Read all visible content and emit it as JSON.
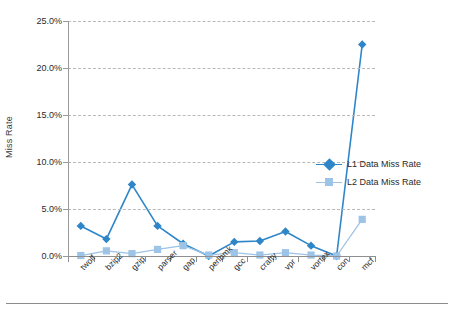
{
  "chart_data": {
    "type": "line",
    "title": "",
    "xlabel": "",
    "ylabel": "Miss Rate",
    "categories": [
      "twolf",
      "bzip2",
      "gzip",
      "parser",
      "gap",
      "perlbmk",
      "gcc",
      "crafty",
      "vpr",
      "vortex",
      "con",
      "mcf"
    ],
    "ylim": [
      0,
      25
    ],
    "ytick_labels": [
      "0.0%",
      "5.0%",
      "10.0%",
      "15.0%",
      "20.0%",
      "25.0%"
    ],
    "ytick_values": [
      0,
      5,
      10,
      15,
      20,
      25
    ],
    "grid": true,
    "grid_style": "dashed-horizontal",
    "legend_position": "right",
    "series": [
      {
        "name": "L1 Data Miss Rate",
        "color": "#2E86C8",
        "marker": "diamond",
        "values": [
          3.2,
          1.8,
          7.6,
          3.2,
          1.3,
          0.0,
          1.5,
          1.6,
          2.6,
          1.1,
          0.0,
          22.5
        ]
      },
      {
        "name": "L2 Data Miss Rate",
        "color": "#9DC3E6",
        "marker": "square",
        "values": [
          0.05,
          0.55,
          0.25,
          0.7,
          1.1,
          0.1,
          0.35,
          0.1,
          0.35,
          0.1,
          0.0,
          3.9
        ]
      }
    ]
  },
  "axes": {
    "y_title": "Miss Rate"
  },
  "legend": {
    "entries": [
      {
        "label": "L1 Data Miss Rate"
      },
      {
        "label": "L2 Data Miss Rate"
      }
    ]
  },
  "colors": {
    "series_l1": "#2E86C8",
    "series_l2": "#9DC3E6",
    "grid": "#b9b9b9",
    "axis": "#8f8f8f",
    "text": "#2b2b2b",
    "background": "#ffffff"
  }
}
